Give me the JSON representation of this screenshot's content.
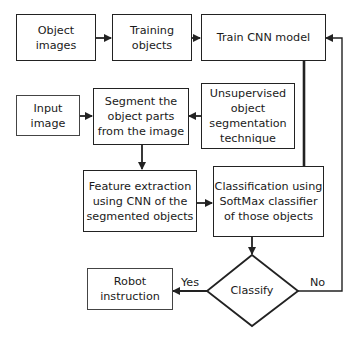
{
  "diagram": {
    "nodes": {
      "object_images": "Object\nimages",
      "training_objects": "Training\nobjects",
      "train_cnn": "Train CNN model",
      "input_image": "Input\nimage",
      "segment": "Segment the\nobject parts\nfrom the image",
      "unsupervised": "Unsupervised\nobject\nsegmentation\ntechnique",
      "feature_extraction": "Feature extraction\nusing CNN of the\nsegmented objects",
      "classification": "Classification using\nSoftMax classifier\nof those objects",
      "classify": "Classify",
      "robot_instruction": "Robot\ninstruction"
    },
    "edge_labels": {
      "yes": "Yes",
      "no": "No"
    },
    "edges": [
      {
        "from": "Object images",
        "to": "Training objects"
      },
      {
        "from": "Training objects",
        "to": "Train CNN model"
      },
      {
        "from": "Train CNN model",
        "to": "Classification using SoftMax classifier of those objects"
      },
      {
        "from": "Input image",
        "to": "Segment the object parts from the image"
      },
      {
        "from": "Unsupervised object segmentation technique",
        "to": "Segment the object parts from the image"
      },
      {
        "from": "Segment the object parts from the image",
        "to": "Feature extraction using CNN of the segmented objects"
      },
      {
        "from": "Feature extraction using CNN of the segmented objects",
        "to": "Classification using SoftMax classifier of those objects"
      },
      {
        "from": "Classification using SoftMax classifier of those objects",
        "to": "Classify"
      },
      {
        "from": "Classify",
        "to": "Robot instruction",
        "label": "Yes"
      },
      {
        "from": "Classify",
        "to": "Train CNN model",
        "label": "No"
      }
    ]
  }
}
